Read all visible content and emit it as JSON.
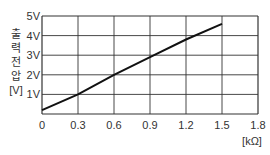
{
  "chart_data": {
    "type": "line",
    "title": "",
    "xlabel": "[kΩ]",
    "ylabel": "출력전압 [V]",
    "ylabel_chars": [
      "출",
      "력",
      "전",
      "압"
    ],
    "ylabel_unit": "[V]",
    "x_ticks": [
      "0",
      "0.3",
      "0.6",
      "0.9",
      "1.2",
      "1.5",
      "1.8"
    ],
    "y_ticks": [
      "1V",
      "2V",
      "3V",
      "4V",
      "5V"
    ],
    "xlim": [
      0,
      1.8
    ],
    "ylim": [
      0,
      5
    ],
    "grid": true,
    "legend": null,
    "series": [
      {
        "name": "output voltage",
        "x": [
          0,
          0.3,
          0.6,
          0.9,
          1.2,
          1.5
        ],
        "values": [
          0.2,
          1.0,
          2.0,
          2.9,
          3.8,
          4.6
        ]
      }
    ]
  },
  "colors": {
    "line": "#111111",
    "grid": "#333333",
    "text": "#333333"
  }
}
